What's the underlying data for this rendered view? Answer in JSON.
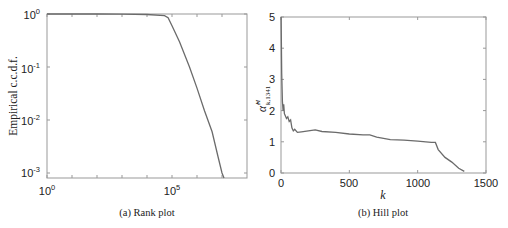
{
  "chart_data": [
    {
      "type": "line",
      "title": "",
      "caption": "(a) Rank plot",
      "xlabel": "",
      "ylabel": "Empirical c.c.d.f.",
      "xscale": "log",
      "yscale": "log",
      "xlim": [
        1,
        1000000000
      ],
      "ylim": [
        0.00075,
        1
      ],
      "xticks": [
        "10^0",
        "10^5"
      ],
      "yticks": [
        "10^0",
        "10^-1",
        "10^-2",
        "10^-3"
      ],
      "grid": false,
      "legend": null,
      "series": [
        {
          "name": "ccdf",
          "x": [
            1,
            10,
            100,
            1000,
            10000,
            50000,
            70000,
            100000,
            200000,
            500000,
            1000000,
            2000000,
            4000000,
            7000000,
            10000000,
            12000000
          ],
          "y": [
            1,
            1,
            0.999,
            0.995,
            0.98,
            0.93,
            0.85,
            0.6,
            0.3,
            0.1,
            0.04,
            0.015,
            0.006,
            0.002,
            0.001,
            0.00075
          ]
        }
      ]
    },
    {
      "type": "line",
      "title": "",
      "caption": "(b) Hill plot",
      "xlabel": "k",
      "ylabel": "α̂^H_{k,1341}",
      "xlim": [
        0,
        1500
      ],
      "ylim": [
        0,
        5
      ],
      "xticks": [
        0,
        500,
        1000,
        1500
      ],
      "yticks": [
        0,
        1,
        2,
        3,
        4,
        5
      ],
      "grid": false,
      "legend": null,
      "series": [
        {
          "name": "hill",
          "x": [
            1,
            5,
            10,
            15,
            20,
            25,
            30,
            40,
            50,
            60,
            70,
            80,
            90,
            100,
            120,
            150,
            200,
            250,
            300,
            400,
            500,
            600,
            650,
            700,
            800,
            900,
            1000,
            1100,
            1130,
            1150,
            1200,
            1250,
            1300,
            1341
          ],
          "y": [
            5.0,
            3.2,
            2.3,
            2.0,
            2.2,
            1.9,
            1.85,
            1.75,
            1.8,
            1.65,
            1.7,
            1.45,
            1.35,
            1.4,
            1.3,
            1.32,
            1.35,
            1.38,
            1.33,
            1.3,
            1.25,
            1.22,
            1.22,
            1.15,
            1.07,
            1.05,
            1.02,
            0.98,
            0.98,
            0.75,
            0.5,
            0.35,
            0.15,
            0.05
          ]
        }
      ]
    }
  ],
  "labels": {
    "a_caption": "(a) Rank plot",
    "b_caption": "(b) Hill plot",
    "a_ylabel": "Empirical c.c.d.f.",
    "b_xlabel": "k",
    "b_ylabel_base": "α̂",
    "b_ylabel_sup": "H",
    "b_ylabel_sub": "k,1341"
  },
  "colors": {
    "line": "#6b6b6b",
    "axis": "#888888",
    "text": "#222222"
  }
}
